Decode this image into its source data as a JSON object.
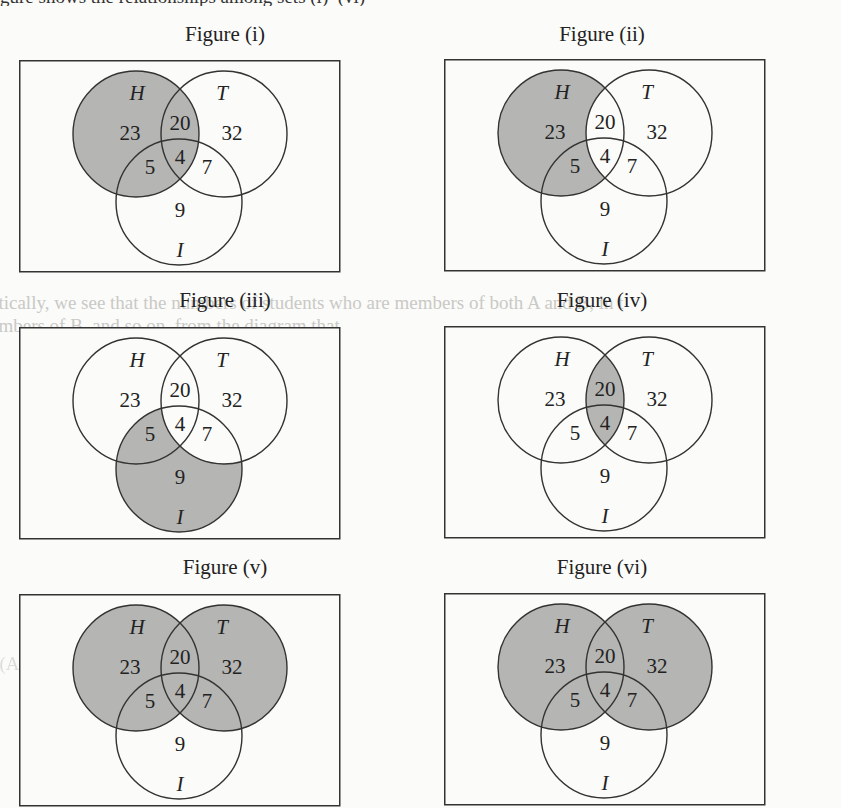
{
  "page": {
    "top_cutoff_text": "gure shows the relationships among sets (i)–(vi)"
  },
  "style": {
    "shade_color": "#b5b5b3",
    "line_color": "#333333",
    "text_color": "#222222",
    "background": "#fbfbf9"
  },
  "sets": {
    "H": "H",
    "T": "T",
    "I": "I"
  },
  "regions": {
    "H_only": "23",
    "H_and_T_only": "20",
    "T_only": "32",
    "H_and_T_and_I": "4",
    "H_and_I_only": "5",
    "T_and_I_only": "7",
    "I_only": "9"
  },
  "figures": [
    {
      "id": "i",
      "title": "Figure (i)",
      "shaded": "H",
      "shaded_regions": [
        "H_only",
        "H_and_T_only",
        "H_and_I_only",
        "H_and_T_and_I"
      ]
    },
    {
      "id": "ii",
      "title": "Figure (ii)",
      "shaded": "H - T",
      "shaded_regions": [
        "H_only",
        "H_and_I_only"
      ]
    },
    {
      "id": "iii",
      "title": "Figure (iii)",
      "shaded": "I - T",
      "shaded_regions": [
        "H_and_I_only",
        "I_only"
      ]
    },
    {
      "id": "iv",
      "title": "Figure (iv)",
      "shaded": "H ∩ T",
      "shaded_regions": [
        "H_and_T_only",
        "H_and_T_and_I"
      ]
    },
    {
      "id": "v",
      "title": "Figure (v)",
      "shaded": "H ∪ T",
      "shaded_regions": [
        "H_only",
        "H_and_T_only",
        "T_only",
        "H_and_I_only",
        "H_and_T_and_I",
        "T_and_I_only"
      ]
    },
    {
      "id": "vi",
      "title": "Figure (vi)",
      "shaded": "H ∪ T",
      "shaded_regions": [
        "H_only",
        "H_and_T_only",
        "T_only",
        "H_and_I_only",
        "H_and_T_and_I",
        "T_and_I_only"
      ]
    }
  ],
  "bleed_through": {
    "line1": "ctically, we see that the numbers of students who are members of both A and B, in t",
    "line2": "embers of B, and so on, from the diagram that",
    "line3": "n(A ∪ B) = x + ... (x + y + z) ..."
  }
}
